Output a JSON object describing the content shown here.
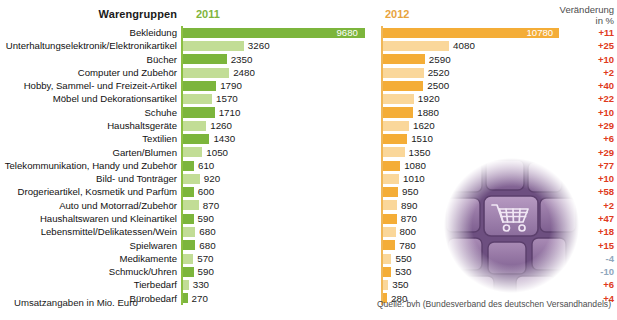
{
  "header": {
    "category_label": "Warengruppen",
    "year_2011": "2011",
    "year_2012": "2012",
    "change_label_line1": "Veränderung",
    "change_label_line2": "in %"
  },
  "footnotes": {
    "left": "Umsatzangaben in Mio. Euro",
    "right": "Quelle: bvh (Bundesverband des deutschen Versandhandels)"
  },
  "colors": {
    "green_dark": "#7cb53c",
    "green_light": "#c2dd96",
    "orange_dark": "#f4ad37",
    "orange_light": "#fad79a",
    "pct_positive": "#e03a20",
    "pct_negative": "#8fa7bd",
    "axis_green": "#8cbf42",
    "axis_orange": "#f0b757",
    "label_text": "#111111"
  },
  "icons": {
    "keyboard": "keyboard-icon",
    "cart": "shopping-cart-icon"
  },
  "chart_data": {
    "type": "bar",
    "title": "Warengruppen",
    "subtitle": "",
    "xlabel": "",
    "ylabel": "",
    "orientation": "horizontal",
    "grid": false,
    "legend_position": "top",
    "units": "Mio. Euro",
    "xlim_2011": [
      0,
      9680
    ],
    "xlim_2012": [
      0,
      10780
    ],
    "categories": [
      "Bekleidung",
      "Unterhaltungselektronik/Elektronikartikel",
      "Bücher",
      "Computer und Zubehör",
      "Hobby, Sammel- und Freizeit-Artikel",
      "Möbel und Dekorationsartikel",
      "Schuhe",
      "Haushaltsgeräte",
      "Textilien",
      "Garten/Blumen",
      "Telekommunikation, Handy und Zubehör",
      "Bild- und Tonträger",
      "Drogerieartikel, Kosmetik und Parfüm",
      "Auto und Motorrad/Zubehör",
      "Haushaltswaren und Kleinartikel",
      "Lebensmittel/Delikatessen/Wein",
      "Spielwaren",
      "Medikamente",
      "Schmuck/Uhren",
      "Tierbedarf",
      "Bürobedarf"
    ],
    "series": [
      {
        "name": "2011",
        "values": [
          9680,
          3260,
          2350,
          2480,
          1790,
          1570,
          1710,
          1260,
          1430,
          1050,
          610,
          920,
          600,
          870,
          590,
          680,
          680,
          570,
          590,
          330,
          270
        ]
      },
      {
        "name": "2012",
        "values": [
          10780,
          4080,
          2590,
          2520,
          2500,
          1920,
          1880,
          1620,
          1510,
          1350,
          1080,
          1010,
          950,
          890,
          870,
          800,
          780,
          550,
          530,
          350,
          280
        ]
      },
      {
        "name": "Veränderung in %",
        "values": [
          11,
          25,
          10,
          2,
          40,
          22,
          10,
          29,
          6,
          29,
          77,
          10,
          58,
          2,
          47,
          18,
          15,
          -4,
          -10,
          6,
          4
        ]
      }
    ],
    "change_labels": [
      "+11",
      "+25",
      "+10",
      "+2",
      "+40",
      "+22",
      "+10",
      "+29",
      "+6",
      "+29",
      "+77",
      "+10",
      "+58",
      "+2",
      "+47",
      "+18",
      "+15",
      "-4",
      "-10",
      "+6",
      "+4"
    ]
  }
}
